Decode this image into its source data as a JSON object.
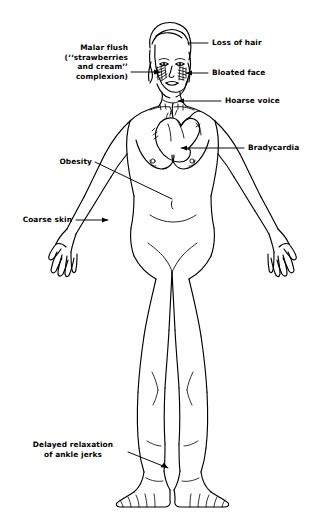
{
  "figure": {
    "background_color": "#ffffff",
    "ink_color": "#000000",
    "line_style": "hand-drawn pen line art"
  },
  "annotations": [
    {
      "id": "malar-flush",
      "text": "Malar flush\n(‘‘strawberries\nand cream’’\ncomplexion)",
      "lines": [
        "Malar flush",
        "(‘‘strawberries",
        "and cream’’",
        "complexion)"
      ],
      "side": "left",
      "align": "right",
      "x": 50,
      "y": 43,
      "width": 78,
      "leader": "horizontal arrow to left cheek",
      "target": "left cheek (hatched malar patch)"
    },
    {
      "id": "loss-of-hair",
      "text": "Loss of hair",
      "lines": [
        "Loss of hair"
      ],
      "side": "right",
      "align": "left",
      "x": 212,
      "y": 40,
      "width": 90,
      "leader": "horizontal line to scalp",
      "target": "scalp / hairline"
    },
    {
      "id": "bloated-face",
      "text": "Bloated face",
      "lines": [
        "Bloated face"
      ],
      "side": "right",
      "align": "left",
      "x": 212,
      "y": 70,
      "width": 90,
      "leader": "horizontal arrow to right cheek",
      "target": "right cheek"
    },
    {
      "id": "hoarse-voice",
      "text": "Hoarse voice",
      "lines": [
        "Hoarse voice"
      ],
      "side": "right",
      "align": "left",
      "x": 225,
      "y": 97,
      "width": 84,
      "leader": "horizontal arrow to larynx",
      "target": "larynx / base of neck"
    },
    {
      "id": "bradycardia",
      "text": "Bradycardia",
      "lines": [
        "Bradycardia"
      ],
      "side": "right",
      "align": "left",
      "x": 248,
      "y": 144,
      "width": 62,
      "leader": "long horizontal arrow to heart",
      "target": "heart (left ventricle)"
    },
    {
      "id": "obesity",
      "text": "Obesity",
      "lines": [
        "Obesity"
      ],
      "side": "left",
      "align": "right",
      "x": 42,
      "y": 159,
      "width": 50,
      "leader": "diagonal line down-right to abdomen",
      "target": "abdomen"
    },
    {
      "id": "coarse-skin",
      "text": "Coarse skin",
      "lines": [
        "Coarse skin"
      ],
      "side": "left",
      "align": "right",
      "x": 10,
      "y": 216,
      "width": 62,
      "leader": "horizontal arrow to forearm",
      "target": "left forearm skin"
    },
    {
      "id": "delayed-relaxation",
      "text": "Delayed relaxation\nof ankle jerks",
      "lines": [
        "Delayed relaxation",
        "of ankle jerks"
      ],
      "side": "left",
      "align": "center",
      "x": 48,
      "y": 440,
      "width": 106,
      "leader": "diagonal arrow down-right to ankle",
      "target": "right ankle / Achilles tendon"
    }
  ],
  "figure_parts": [
    {
      "id": "head",
      "label": "head"
    },
    {
      "id": "hair",
      "label": "hair"
    },
    {
      "id": "eyes",
      "label": "eyes"
    },
    {
      "id": "nose",
      "label": "nose"
    },
    {
      "id": "mouth",
      "label": "mouth"
    },
    {
      "id": "malar-hatching-left",
      "label": "left cheek hatching"
    },
    {
      "id": "malar-hatching-right",
      "label": "right cheek hatching"
    },
    {
      "id": "neck",
      "label": "neck"
    },
    {
      "id": "clavicles",
      "label": "clavicles"
    },
    {
      "id": "torso",
      "label": "torso"
    },
    {
      "id": "breasts",
      "label": "breasts"
    },
    {
      "id": "heart-overlay",
      "label": "heart diagram overlay"
    },
    {
      "id": "navel",
      "label": "navel"
    },
    {
      "id": "left-arm",
      "label": "left arm"
    },
    {
      "id": "right-arm",
      "label": "right arm"
    },
    {
      "id": "left-hand",
      "label": "left hand"
    },
    {
      "id": "right-hand",
      "label": "right hand"
    },
    {
      "id": "hips",
      "label": "hips"
    },
    {
      "id": "left-leg",
      "label": "left leg"
    },
    {
      "id": "right-leg",
      "label": "right leg"
    },
    {
      "id": "left-foot",
      "label": "left foot"
    },
    {
      "id": "right-foot",
      "label": "right foot"
    }
  ]
}
